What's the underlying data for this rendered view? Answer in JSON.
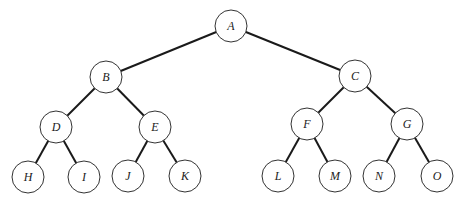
{
  "diagram": {
    "type": "binary-tree",
    "node_radius": 16,
    "colors": {
      "edge": "#1a1a1a",
      "node_stroke": "#333333",
      "node_fill": "#ffffff",
      "label": "#222222"
    },
    "nodes": [
      {
        "id": "A",
        "label": "A",
        "x": 231,
        "y": 26
      },
      {
        "id": "B",
        "label": "B",
        "x": 106,
        "y": 77
      },
      {
        "id": "C",
        "label": "C",
        "x": 355,
        "y": 76
      },
      {
        "id": "D",
        "label": "D",
        "x": 56,
        "y": 127
      },
      {
        "id": "E",
        "label": "E",
        "x": 155,
        "y": 127
      },
      {
        "id": "F",
        "label": "F",
        "x": 307,
        "y": 124
      },
      {
        "id": "G",
        "label": "G",
        "x": 407,
        "y": 124
      },
      {
        "id": "H",
        "label": "H",
        "x": 28,
        "y": 177
      },
      {
        "id": "I",
        "label": "I",
        "x": 84,
        "y": 177
      },
      {
        "id": "J",
        "label": "J",
        "x": 128,
        "y": 176
      },
      {
        "id": "K",
        "label": "K",
        "x": 185,
        "y": 176
      },
      {
        "id": "L",
        "label": "L",
        "x": 278,
        "y": 176
      },
      {
        "id": "M",
        "label": "M",
        "x": 335,
        "y": 176
      },
      {
        "id": "N",
        "label": "N",
        "x": 379,
        "y": 176
      },
      {
        "id": "O",
        "label": "O",
        "x": 437,
        "y": 176
      }
    ],
    "edges": [
      [
        "A",
        "B"
      ],
      [
        "A",
        "C"
      ],
      [
        "B",
        "D"
      ],
      [
        "B",
        "E"
      ],
      [
        "C",
        "F"
      ],
      [
        "C",
        "G"
      ],
      [
        "D",
        "H"
      ],
      [
        "D",
        "I"
      ],
      [
        "E",
        "J"
      ],
      [
        "E",
        "K"
      ],
      [
        "F",
        "L"
      ],
      [
        "F",
        "M"
      ],
      [
        "G",
        "N"
      ],
      [
        "G",
        "O"
      ]
    ]
  }
}
